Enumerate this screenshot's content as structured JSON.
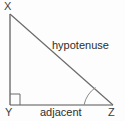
{
  "figure": {
    "type": "right-triangle-geometry-diagram",
    "background_color": "#fdfdfd",
    "stroke_color": "#555555",
    "text_color": "#2e2e2e"
  },
  "vertices": [
    {
      "name": "X",
      "label": "X",
      "x": 10,
      "y": 14
    },
    {
      "name": "Y",
      "label": "Y",
      "x": 10,
      "y": 105
    },
    {
      "name": "Z",
      "label": "Z",
      "x": 113,
      "y": 105
    }
  ],
  "sides": [
    {
      "name": "opposite",
      "label": "",
      "from": "X",
      "to": "Y"
    },
    {
      "name": "adjacent",
      "label": "adjacent",
      "from": "Y",
      "to": "Z"
    },
    {
      "name": "hypotenuse",
      "label": "hypotenuse",
      "from": "X",
      "to": "Z"
    }
  ],
  "markers": {
    "right_angle": {
      "at_vertex": "Y",
      "label": "right-angle-square",
      "size": 10
    },
    "angle_arc": {
      "at_vertex": "Z",
      "label": "angle-arc"
    }
  }
}
